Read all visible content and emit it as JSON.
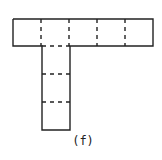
{
  "figure": {
    "label": "(f)",
    "stroke_color": "#222222",
    "background": "#ffffff",
    "outline": [
      [
        13,
        19
      ],
      [
        153,
        19
      ],
      [
        153,
        46
      ],
      [
        70,
        46
      ],
      [
        70,
        130
      ],
      [
        42,
        130
      ],
      [
        42,
        46
      ],
      [
        13,
        46
      ],
      [
        13,
        19
      ]
    ],
    "fold_lines": [
      {
        "x1": 41,
        "y1": 19,
        "x2": 41,
        "y2": 46
      },
      {
        "x1": 69,
        "y1": 19,
        "x2": 69,
        "y2": 46
      },
      {
        "x1": 97,
        "y1": 19,
        "x2": 97,
        "y2": 46
      },
      {
        "x1": 125,
        "y1": 19,
        "x2": 125,
        "y2": 46
      },
      {
        "x1": 42,
        "y1": 46,
        "x2": 70,
        "y2": 46
      },
      {
        "x1": 42,
        "y1": 74,
        "x2": 70,
        "y2": 74
      },
      {
        "x1": 42,
        "y1": 102,
        "x2": 70,
        "y2": 102
      }
    ]
  }
}
